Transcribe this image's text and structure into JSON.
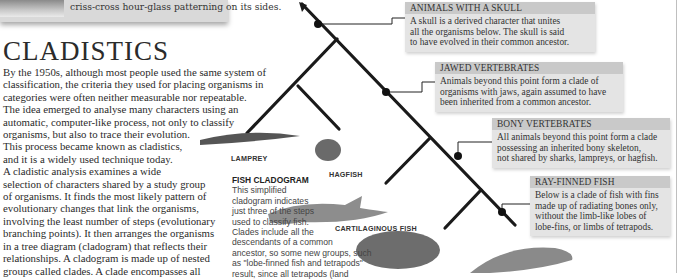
{
  "photo_caption": {
    "text": "criss-cross hour-glass patterning on its sides."
  },
  "article": {
    "title": "CLADISTICS",
    "paragraph_lines": [
      "By the 1950s, although most people used the same system of",
      "classification, the criteria they used for placing organisms in",
      "categories were often neither measurable nor repeatable.",
      "The idea emerged to analyse many characters using an",
      "automatic, computer-like process, not only to classify",
      "organisms, but also to trace their evolution.",
      "This process became known as cladistics,",
      "and it is a widely used technique today.",
      "A cladistic analysis examines a wide",
      "selection of characters shared by a study group",
      "of organisms. It finds the most likely pattern of",
      "evolutionary changes that link the organisms,",
      "involving the least number of steps (evolutionary",
      "branching points). It then arranges the organisms",
      "in a tree diagram (cladogram) that reflects their",
      "relationships. A cladogram is made up of nested",
      "groups called clades. A clade encompasses all"
    ]
  },
  "sidebar_caption": {
    "title": "FISH CLADOGRAM",
    "lines": [
      "This simplified",
      "cladogram indicates",
      "just three of the steps",
      "used to classify fish.",
      "Clades include all the",
      "descendants of a common",
      "ancestor, so some new groups, such",
      "as \"lobe-finned fish and tetrapods\"",
      "result, since all tetrapods (land"
    ]
  },
  "organisms": {
    "lamprey": "LAMPREY",
    "hagfish": "HAGFISH",
    "cartilaginous": "CARTILAGINOUS FISH"
  },
  "clades": [
    {
      "title": "Animals with a skull",
      "lines": [
        "A skull is a derived character that unites",
        "all the organisms below. The skull is said",
        "to have evolved in their common ancestor."
      ]
    },
    {
      "title": "Jawed vertebrates",
      "lines": [
        "Animals beyond this point form a clade of",
        "organisms with jaws, again assumed to have",
        "been inherited from a common ancestor."
      ]
    },
    {
      "title": "Bony vertebrates",
      "lines": [
        "All animals beyond this point form a clade",
        "possessing an inherited bony skeleton,",
        "not shared by sharks, lampreys, or hagfish."
      ]
    },
    {
      "title": "Ray-finned fish",
      "lines": [
        "Below is a clade of fish with fins",
        "made up of radiating bones only,",
        "without the limb-like lobes of",
        "lobe-fins, or limbs of tetrapods."
      ]
    }
  ],
  "colors": {
    "box_bg": "#e4e4e4",
    "box_title_bg": "#c9c9c9",
    "tree_line": "#1a1a1a"
  }
}
